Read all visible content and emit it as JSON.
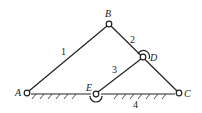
{
  "diagram": {
    "type": "planar-linkage-mechanism",
    "colors": {
      "line": "#222222",
      "background": "#ffffff"
    },
    "joints": [
      {
        "id": "A",
        "label": "A",
        "x": 27,
        "y": 93,
        "label_x": 15,
        "label_y": 96
      },
      {
        "id": "B",
        "label": "B",
        "x": 109,
        "y": 24,
        "label_x": 105,
        "label_y": 17
      },
      {
        "id": "C",
        "label": "C",
        "x": 179,
        "y": 93,
        "label_x": 185,
        "label_y": 97
      },
      {
        "id": "D",
        "label": "D",
        "x": 143,
        "y": 57,
        "label_x": 151,
        "label_y": 61
      },
      {
        "id": "E",
        "label": "E",
        "x": 96,
        "y": 94,
        "label_x": 87,
        "label_y": 91
      }
    ],
    "links": [
      {
        "id": "1",
        "label": "1",
        "from": "A",
        "to": "B",
        "label_x": 62,
        "label_y": 54
      },
      {
        "id": "2",
        "label": "2",
        "from": "B",
        "to": "C",
        "label_x": 132,
        "label_y": 42
      },
      {
        "id": "3",
        "label": "3",
        "from": "E",
        "to": "D",
        "label_x": 114,
        "label_y": 72
      },
      {
        "id": "4",
        "label": "4",
        "from": "A",
        "to": "C",
        "label_x": 135,
        "label_y": 107,
        "ground": true
      }
    ]
  }
}
